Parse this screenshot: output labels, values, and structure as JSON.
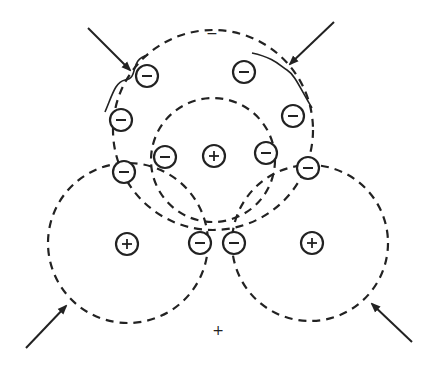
{
  "diagram": {
    "stroke_color": "#222222",
    "background": "#ffffff",
    "labels": {
      "top_sign": "−",
      "bottom_sign": "+"
    },
    "dashed_circles": [
      {
        "name": "outer-top-orbit",
        "cx": 213,
        "cy": 130,
        "r": 100
      },
      {
        "name": "inner-orbit",
        "cx": 213,
        "cy": 160,
        "r": 62
      },
      {
        "name": "left-orbit",
        "cx": 128,
        "cy": 243,
        "r": 80
      },
      {
        "name": "right-orbit",
        "cx": 310,
        "cy": 243,
        "r": 78
      }
    ],
    "electrons": [
      {
        "x": 147,
        "y": 76
      },
      {
        "x": 244,
        "y": 72
      },
      {
        "x": 121,
        "y": 120
      },
      {
        "x": 293,
        "y": 116
      },
      {
        "x": 124,
        "y": 172
      },
      {
        "x": 308,
        "y": 168
      },
      {
        "x": 165,
        "y": 157
      },
      {
        "x": 266,
        "y": 153
      },
      {
        "x": 200,
        "y": 243
      },
      {
        "x": 234,
        "y": 243
      }
    ],
    "nuclei": [
      {
        "x": 214,
        "y": 156
      },
      {
        "x": 127,
        "y": 244
      },
      {
        "x": 312,
        "y": 243
      }
    ],
    "arrows": [
      {
        "name": "arrow-top-left",
        "x1": 88,
        "y1": 28,
        "x2": 130,
        "y2": 70
      },
      {
        "name": "arrow-top-right",
        "x1": 334,
        "y1": 22,
        "x2": 290,
        "y2": 64
      },
      {
        "name": "arrow-bottom-left",
        "x1": 26,
        "y1": 348,
        "x2": 66,
        "y2": 306
      },
      {
        "name": "arrow-bottom-right",
        "x1": 412,
        "y1": 342,
        "x2": 372,
        "y2": 304
      }
    ],
    "braces": [
      {
        "name": "brace-left",
        "path": "M 148 55 C 128 60, 140 78, 125 80 C 115 82, 112 96, 105 112"
      },
      {
        "name": "brace-right",
        "path": "M 252 53 C 275 58, 280 66, 287 70 C 295 75, 300 88, 312 108"
      }
    ],
    "sign_positions": {
      "top": {
        "x": 212,
        "y": 33
      },
      "bottom": {
        "x": 218,
        "y": 330
      }
    }
  }
}
